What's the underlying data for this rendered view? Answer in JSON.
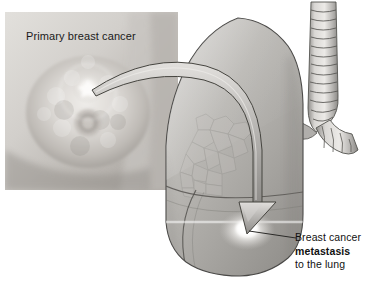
{
  "figure": {
    "type": "medical-illustration",
    "subject": "Breast cancer metastasis to the lung",
    "background_color": "#ffffff",
    "width": 381,
    "height": 304
  },
  "photo_panel": {
    "name": "primary-breast-cancer-photo",
    "title": "Primary breast cancer",
    "frame": {
      "x": 5,
      "y": 12,
      "width": 173,
      "height": 178
    },
    "tumor_marker": {
      "label": "tumor-highlight",
      "x": 88,
      "y": 88
    },
    "areola": {
      "label": "areola-nipple",
      "x": 88,
      "y": 123
    },
    "colors": {
      "skin_light": "#d9d6d2",
      "skin_mid": "#bdb9b4",
      "skin_shadow": "#908c88",
      "tumor": "#f4f2ef"
    }
  },
  "lung": {
    "name": "lung-illustration",
    "colors": {
      "body_light": "#c2c0bd",
      "body_mid": "#a6a4a1",
      "body_shadow": "#86847f",
      "outline": "#4a4947",
      "alveolar": "#b4b2af",
      "lesion": "#fbfaf8"
    },
    "lesion": {
      "label": "metastatic-lesion",
      "x": 247,
      "y": 230
    },
    "fissures": 2,
    "alveolar_patch": true
  },
  "airway": {
    "name": "trachea-and-bronchus",
    "cartilage_rings": 13,
    "colors": {
      "ring_light": "#d4d2cf",
      "ring_mid": "#aeaca9",
      "outline": "#4f4e4c"
    }
  },
  "metastasis_arrow": {
    "name": "metastasis-flow-arrow",
    "from": "primary breast tumor",
    "to": "lung lesion",
    "colors": {
      "fill_light": "#cfcdca",
      "fill_mid": "#a3a19e",
      "outline": "#44433f"
    }
  },
  "caption": {
    "name": "metastasis-caption",
    "lines": [
      {
        "text": "Breast cancer",
        "bold": false
      },
      {
        "text": "metastasis",
        "bold": true
      },
      {
        "text": "to the lung",
        "bold": false
      }
    ],
    "leader_line": {
      "from_x": 296,
      "from_y": 238,
      "to_x": 249,
      "to_y": 231
    }
  }
}
